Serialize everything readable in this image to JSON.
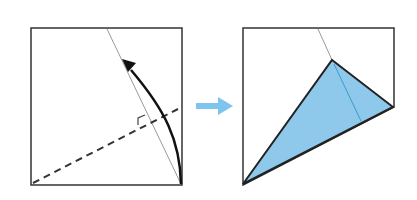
{
  "diagram": {
    "type": "origami-fold-instruction",
    "steps": [
      {
        "id": "before",
        "paper_color": "#ffffff",
        "outline_color": "#333333",
        "elements": [
          "square-paper",
          "reference-crease",
          "valley-fold-line",
          "right-angle-mark",
          "fold-arrow"
        ]
      },
      {
        "id": "after",
        "paper_color": "#ffffff",
        "flap_color": "#8ec8ea",
        "outline_color": "#222222",
        "elements": [
          "folded-paper",
          "folded-flap",
          "crease-line"
        ]
      }
    ],
    "transition_arrow_color": "#7fc4ec"
  }
}
